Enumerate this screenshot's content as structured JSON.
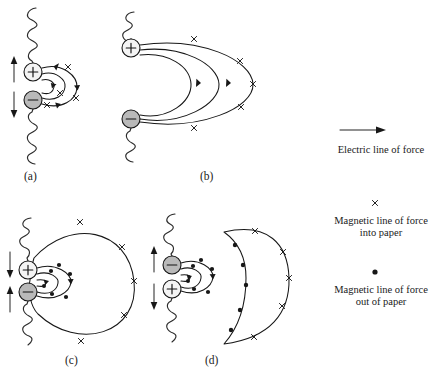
{
  "figure": {
    "type": "physics-diagram",
    "background_color": "#ffffff",
    "ink_color": "#171717"
  },
  "panels": [
    {
      "id": "a",
      "label": "(a)",
      "label_x": 24,
      "label_y": 180,
      "charges": [
        {
          "sign": "+",
          "name": "positive-charge",
          "cx": 33,
          "cy": 72,
          "r": 9,
          "fill": "#f4f4f4"
        },
        {
          "sign": "−",
          "name": "negative-charge",
          "cx": 33,
          "cy": 100,
          "r": 9,
          "fill": "#b9b9b9"
        }
      ],
      "motion_arrows": [
        {
          "name": "up-arrow",
          "direction": "up",
          "x": 14,
          "y_top": 58,
          "y_bottom": 82
        },
        {
          "name": "down-arrow",
          "direction": "down",
          "x": 14,
          "y_top": 92,
          "y_bottom": 116
        }
      ],
      "field_marks": "x",
      "field_mark_meaning": "into paper",
      "description": "Charges separating; small field loops close to the dipole carry cross marks."
    },
    {
      "id": "b",
      "label": "(b)",
      "label_x": 200,
      "label_y": 180,
      "charges": [
        {
          "sign": "+",
          "name": "positive-charge",
          "cx": 131,
          "cy": 48,
          "r": 9,
          "fill": "#f4f4f4"
        },
        {
          "sign": "−",
          "name": "negative-charge",
          "cx": 131,
          "cy": 119,
          "r": 9,
          "fill": "#b9b9b9"
        }
      ],
      "motion_arrows": [],
      "field_marks": "x and arrowheads",
      "field_mark_meaning": "into paper",
      "description": "Charges fully separated; three nested electric arcs span from + to -, outer arc carries cross marks."
    },
    {
      "id": "c",
      "label": "(c)",
      "label_x": 65,
      "label_y": 364,
      "charges": [
        {
          "sign": "+",
          "name": "positive-charge",
          "cx": 28,
          "cy": 270,
          "r": 9,
          "fill": "#f4f4f4"
        },
        {
          "sign": "−",
          "name": "negative-charge",
          "cx": 28,
          "cy": 292,
          "r": 9,
          "fill": "#b9b9b9"
        }
      ],
      "motion_arrows": [
        {
          "name": "down-arrow",
          "direction": "down",
          "x": 10,
          "y_top": 252,
          "y_bottom": 276
        },
        {
          "name": "up-arrow",
          "direction": "up",
          "x": 10,
          "y_top": 288,
          "y_bottom": 312
        }
      ],
      "field_marks": "x on outer loop, dot on inner arcs",
      "field_mark_meaning": "outer loop into paper, inner arcs out of paper",
      "description": "Charges re-approaching; large detached outer loop with crosses plus small inner arcs with dots."
    },
    {
      "id": "d",
      "label": "(d)",
      "label_x": 205,
      "label_y": 364,
      "charges": [
        {
          "sign": "−",
          "name": "negative-charge",
          "cx": 172,
          "cy": 265,
          "r": 9,
          "fill": "#b9b9b9"
        },
        {
          "sign": "+",
          "name": "positive-charge",
          "cx": 172,
          "cy": 289,
          "r": 9,
          "fill": "#f4f4f4"
        }
      ],
      "motion_arrows": [
        {
          "name": "up-arrow",
          "direction": "up",
          "x": 154,
          "y_top": 248,
          "y_bottom": 272
        },
        {
          "name": "down-arrow",
          "direction": "down",
          "x": 154,
          "y_top": 284,
          "y_bottom": 308
        }
      ],
      "field_marks": "dot on left edge, x on right curve",
      "field_mark_meaning": "left edge out of paper, right curve into paper",
      "description": "Polarity reversed; detached crescent-shaped radiated field travels outward to the right."
    }
  ],
  "legend": {
    "name": "legend",
    "items": [
      {
        "symbol": "arrow",
        "icon_name": "arrow-right-icon",
        "label": "Electric line of force",
        "label_lines": [
          "Electric line of force"
        ]
      },
      {
        "symbol": "x",
        "icon_name": "cross-icon",
        "label": "Magnetic line of force into paper",
        "label_lines": [
          "Magnetic line of force",
          "into paper"
        ]
      },
      {
        "symbol": "dot",
        "icon_name": "dot-icon",
        "label": "Magnetic line of force out of paper",
        "label_lines": [
          "Magnetic line of force",
          "out of paper"
        ]
      }
    ]
  }
}
